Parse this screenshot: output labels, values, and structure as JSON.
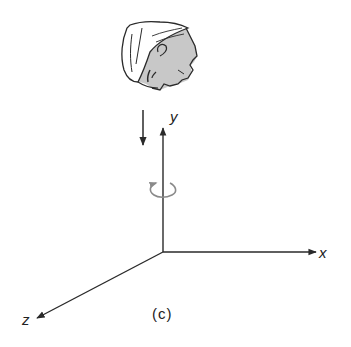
{
  "figure": {
    "caption": "(c)",
    "axes": {
      "x": {
        "label": "x"
      },
      "y": {
        "label": "y"
      },
      "z": {
        "label": "z"
      }
    },
    "annotations": {
      "view_direction": "downward-arrow",
      "rotation": "counterclockwise-rotation-arrow-about-y"
    },
    "colors": {
      "line": "#2a2a2a",
      "shade": "#c8c8c8",
      "rotation_arrow": "#8a8a8a"
    }
  }
}
